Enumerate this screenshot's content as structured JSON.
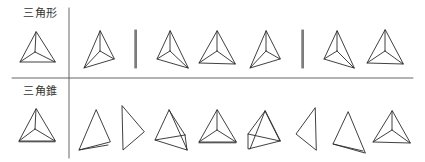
{
  "rows": [
    {
      "label": "三角形",
      "reference": "triangle-with-centroid-lines",
      "variants": [
        "rotated-triangle-with-centroid",
        "edge-on-line",
        "rotated-triangle-with-centroid",
        "rotated-triangle-with-centroid",
        "edge-on-line",
        "rotated-triangle-with-centroid",
        "upright-triangle-with-centroid"
      ]
    },
    {
      "label": "三角錐",
      "reference": "triangular-pyramid-top-view",
      "variants": [
        "tall-pyramid-side",
        "pyramid-profile",
        "pyramid-oblique",
        "pyramid-top-view",
        "pyramid-oblique-crossed",
        "pyramid-profile-left",
        "tall-pyramid-side",
        "pyramid-top-view"
      ]
    }
  ],
  "colors": {
    "stroke": "#2a2a2a",
    "divider": "#555555",
    "text": "#333333"
  }
}
